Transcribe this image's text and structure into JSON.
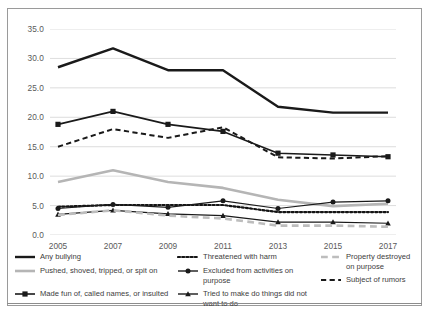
{
  "chart_data": {
    "type": "line",
    "title": "",
    "xlabel": "",
    "ylabel": "",
    "categories": [
      "2005",
      "2007",
      "2009",
      "2011",
      "2013",
      "2015",
      "2017"
    ],
    "x": [
      2005,
      2007,
      2009,
      2011,
      2013,
      2015,
      2017
    ],
    "ylim": [
      0.0,
      35.0
    ],
    "yticks": [
      "0.0",
      "5.0",
      "10.0",
      "15.0",
      "20.0",
      "25.0",
      "30.0",
      "35.0"
    ],
    "ytick_values": [
      0.0,
      5.0,
      10.0,
      15.0,
      20.0,
      25.0,
      30.0,
      35.0
    ],
    "grid": "horizontal",
    "legend_position": "bottom",
    "series": [
      {
        "name": "Any bullying",
        "values": [
          28.5,
          31.7,
          28.0,
          28.0,
          21.8,
          20.8,
          20.8
        ],
        "color": "#1a1a1a",
        "style": "solid",
        "width": 2.4,
        "marker": "none"
      },
      {
        "name": "Made fun of, called names, or insulted",
        "values": [
          18.8,
          21.0,
          18.8,
          17.6,
          13.9,
          13.6,
          13.3
        ],
        "color": "#1a1a1a",
        "style": "solid",
        "width": 1.6,
        "marker": "square"
      },
      {
        "name": "Subject of rumors",
        "values": [
          15.0,
          18.0,
          16.5,
          18.3,
          13.2,
          13.0,
          13.4
        ],
        "color": "#1a1a1a",
        "style": "dashed",
        "width": 2.0,
        "marker": "none"
      },
      {
        "name": "Pushed, shoved, tripped, or spit on",
        "values": [
          9.0,
          11.0,
          9.0,
          8.0,
          6.0,
          4.9,
          5.3
        ],
        "color": "#b5b5b5",
        "style": "solid",
        "width": 2.6,
        "marker": "none"
      },
      {
        "name": "Threatened with harm",
        "values": [
          4.8,
          5.1,
          5.1,
          5.1,
          3.9,
          3.9,
          3.9
        ],
        "color": "#141414",
        "style": "dotted",
        "width": 2.2,
        "marker": "none"
      },
      {
        "name": "Excluded from activities on purpose",
        "values": [
          4.5,
          5.2,
          4.7,
          5.8,
          4.5,
          5.6,
          5.8
        ],
        "color": "#1a1a1a",
        "style": "solid",
        "width": 1.2,
        "marker": "circle"
      },
      {
        "name": "Tried to make do things did not want to do",
        "values": [
          3.5,
          4.2,
          3.6,
          3.3,
          2.2,
          2.2,
          2.0
        ],
        "color": "#1a1a1a",
        "style": "solid",
        "width": 1.2,
        "marker": "triangle"
      },
      {
        "name": "Property destroyed on purpose",
        "values": [
          3.4,
          4.2,
          3.3,
          2.8,
          1.6,
          1.6,
          1.4
        ],
        "color": "#bdbdbd",
        "style": "dashed",
        "width": 2.6,
        "marker": "none"
      }
    ]
  },
  "legend": {
    "column1": [
      "Any bullying",
      "Pushed, shoved, tripped, or spit on",
      "Made fun of, called names, or insulted"
    ],
    "column2": [
      "Threatened with harm",
      "Excluded from activities on purpose",
      "Tried to make do things did not want to do"
    ],
    "column3": [
      "Property destroyed on purpose",
      "Subject of rumors"
    ]
  },
  "colors": {
    "axis_text": "#5a5a5a",
    "gridline": "#d4d4d4",
    "frame": "#9a9a9a",
    "dark_line": "#1a1a1a",
    "gray_line": "#b5b5b5"
  }
}
